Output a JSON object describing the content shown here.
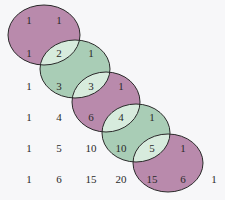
{
  "colors": {
    "purple": "#b98aac",
    "green": "#a9cdb6",
    "overlap": "#d7ebdd",
    "outline": "#2a2a2a",
    "background": "#f7f7f9"
  },
  "rows": [
    [
      "1",
      "1"
    ],
    [
      "1",
      "2",
      "1"
    ],
    [
      "1",
      "3",
      "3",
      "1"
    ],
    [
      "1",
      "4",
      "6",
      "4",
      "1"
    ],
    [
      "1",
      "5",
      "10",
      "10",
      "5",
      "1"
    ],
    [
      "1",
      "6",
      "15",
      "20",
      "15",
      "6",
      "1"
    ]
  ],
  "ellipses": [
    {
      "color": "purple",
      "cells": [
        "1",
        "1",
        "1",
        "2"
      ]
    },
    {
      "color": "green",
      "cells": [
        "2",
        "1",
        "3",
        "3"
      ]
    },
    {
      "color": "purple",
      "cells": [
        "3",
        "1",
        "6",
        "4"
      ]
    },
    {
      "color": "green",
      "cells": [
        "4",
        "1",
        "10",
        "5"
      ]
    },
    {
      "color": "purple",
      "cells": [
        "5",
        "1",
        "15",
        "6"
      ]
    }
  ]
}
